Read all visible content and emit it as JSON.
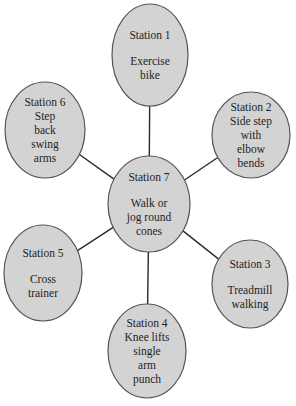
{
  "diagram": {
    "type": "hub-and-spoke circuit",
    "hub": {
      "id": "station-7",
      "title": "Station 7",
      "activity": [
        "Walk or",
        "jog round",
        "cones"
      ],
      "gap_after_title": true
    },
    "stations": [
      {
        "id": "station-1",
        "title": "Station 1",
        "activity": [
          "Exercise",
          "bike"
        ],
        "gap_after_title": true,
        "position": "top"
      },
      {
        "id": "station-2",
        "title": "Station 2",
        "activity": [
          "Side step",
          "with",
          "elbow",
          "bends"
        ],
        "gap_after_title": false,
        "position": "upper-right"
      },
      {
        "id": "station-3",
        "title": "Station 3",
        "activity": [
          "Treadmill",
          "walking"
        ],
        "gap_after_title": true,
        "position": "lower-right"
      },
      {
        "id": "station-4",
        "title": "Station 4",
        "activity": [
          "Knee lifts",
          "single",
          "arm",
          "punch"
        ],
        "gap_after_title": false,
        "position": "bottom"
      },
      {
        "id": "station-5",
        "title": "Station 5",
        "activity": [
          "Cross",
          "trainer"
        ],
        "gap_after_title": true,
        "position": "lower-left"
      },
      {
        "id": "station-6",
        "title": "Station 6",
        "activity": [
          "Step",
          "back",
          "swing",
          "arms"
        ],
        "gap_after_title": false,
        "position": "upper-left"
      }
    ],
    "colors": {
      "node_fill": "#d3d3d3",
      "node_stroke": "#555555",
      "connector": "#2a2a2a",
      "text": "#1e1e1e",
      "background": "#ffffff"
    }
  }
}
